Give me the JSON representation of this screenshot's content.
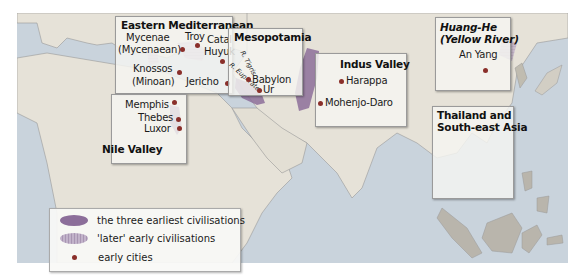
{
  "map": {
    "colors": {
      "sea": "#c9d3dc",
      "land": "#e6e2d8",
      "earliest": "#8c6e9a",
      "later": "#b8a6c2",
      "city_dot": "#8a2f2a"
    },
    "regions": [
      {
        "title": "Eastern Mediterranean",
        "cities": [
          "Mycenae",
          "(Mycenaean)",
          "Troy",
          "Catal",
          "Huyuk",
          "Knossos",
          "(Minoan)",
          "Jericho"
        ]
      },
      {
        "title": "Mesopotamia",
        "cities": [
          "Babylon",
          "Ur"
        ],
        "rivers": [
          "R. Tigris",
          "R. Euphrates"
        ]
      },
      {
        "title": "Indus Valley",
        "cities": [
          "Harappa",
          "Mohenjo-Daro"
        ]
      },
      {
        "title_line1": "Huang-He",
        "title_line2": "(Yellow River)",
        "cities": [
          "An Yang"
        ]
      },
      {
        "title_line1": "Thailand and",
        "title_line2": "South-east Asia",
        "cities": []
      },
      {
        "title": "Nile Valley",
        "cities": [
          "Memphis",
          "Thebes",
          "Luxor"
        ]
      }
    ]
  },
  "legend": {
    "items": [
      {
        "label": "the three earliest civilisations",
        "icon": "dark-purple-blob"
      },
      {
        "label": "'later' early civilisations",
        "icon": "light-hatched-blob"
      },
      {
        "label": "early cities",
        "icon": "red-dot"
      }
    ]
  }
}
